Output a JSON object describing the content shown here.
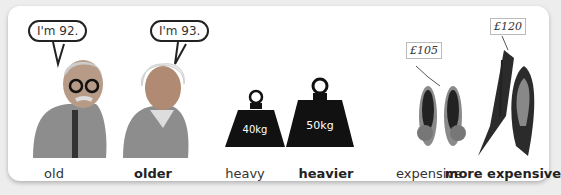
{
  "items": [
    {
      "label": "old",
      "bold": false,
      "speech": "I'm 92."
    },
    {
      "label": "older",
      "bold": true,
      "speech": "I'm 93."
    },
    {
      "label": "heavy",
      "bold": false,
      "weight_text": "40kg"
    },
    {
      "label": "heavier",
      "bold": true,
      "weight_text": "50kg"
    },
    {
      "label": "expensive",
      "bold": false,
      "price": "£105"
    },
    {
      "label": "more expensive",
      "bold": true,
      "price": "£120"
    }
  ],
  "colors": {
    "weight": "#111111",
    "shoe_flat": "#8a8a8a",
    "shoe_heel": "#2b2b2b",
    "person": "#8d8d8d"
  }
}
